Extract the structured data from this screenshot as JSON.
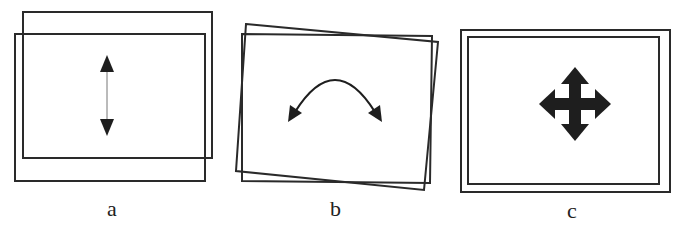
{
  "figure": {
    "panels": [
      {
        "id": "a",
        "label": "a",
        "description": "Two overlapping rectangles offset vertically; vertical double-headed arrow indicating vertical shift (translation)",
        "icon": "vertical-double-arrow-icon"
      },
      {
        "id": "b",
        "label": "b",
        "description": "Two rectangles rotated slightly relative to each other; curved double-headed arrow indicating rotation",
        "icon": "curved-double-arrow-icon"
      },
      {
        "id": "c",
        "label": "c",
        "description": "Two nested concentric rectangles; four-way arrow indicating scaling / movement in all directions",
        "icon": "four-way-arrow-icon"
      }
    ],
    "colors": {
      "stroke": "#2a2a2a",
      "fill": "#1e1e1e",
      "background": "#ffffff"
    }
  }
}
